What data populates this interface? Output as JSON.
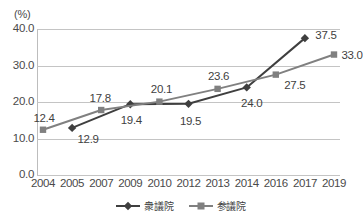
{
  "top_strip": {
    "faint_text": "——  ————  ——  ——————  ——  ———  ————"
  },
  "axis_unit_label": "(%)",
  "legend": {
    "items": [
      {
        "label": "衆議院",
        "marker": "diamond-marker",
        "color": "#3f3f3f"
      },
      {
        "label": "参議院",
        "marker": "square-marker",
        "color": "#808080"
      }
    ]
  },
  "chart_data": {
    "type": "line",
    "title": "",
    "subtitle": "",
    "xlabel": "",
    "ylabel": "(%)",
    "categories": [
      "2004",
      "2005",
      "2007",
      "2009",
      "2010",
      "2012",
      "2013",
      "2014",
      "2016",
      "2017",
      "2019"
    ],
    "ylim": [
      0.0,
      40.0
    ],
    "yticks": [
      "0.0",
      "10.0",
      "20.0",
      "30.0",
      "40.0"
    ],
    "ytick_values": [
      0.0,
      10.0,
      20.0,
      30.0,
      40.0
    ],
    "grid": true,
    "legend_position": "bottom",
    "series": [
      {
        "name": "衆議院",
        "color": "#3f3f3f",
        "marker": "diamond",
        "points": [
          {
            "x": "2005",
            "y": 12.9,
            "label": "12.9",
            "label_dx": 16,
            "label_dy": 11
          },
          {
            "x": "2009",
            "y": 19.4,
            "label": "19.4",
            "label_dx": 1,
            "label_dy": 16
          },
          {
            "x": "2012",
            "y": 19.5,
            "label": "19.5",
            "label_dx": 2,
            "label_dy": 17
          },
          {
            "x": "2014",
            "y": 24.0,
            "label": "24.0",
            "label_dx": 5,
            "label_dy": 16
          },
          {
            "x": "2017",
            "y": 37.5,
            "label": "37.5",
            "label_dx": 21,
            "label_dy": -3
          }
        ]
      },
      {
        "name": "参議院",
        "color": "#808080",
        "marker": "square",
        "points": [
          {
            "x": "2004",
            "y": 12.4,
            "label": "12.4",
            "label_dx": 1,
            "label_dy": -12
          },
          {
            "x": "2007",
            "y": 17.8,
            "label": "17.8",
            "label_dx": -1,
            "label_dy": -12
          },
          {
            "x": "2010",
            "y": 20.1,
            "label": "20.1",
            "label_dx": 2,
            "label_dy": -13
          },
          {
            "x": "2013",
            "y": 23.6,
            "label": "23.6",
            "label_dx": 1,
            "label_dy": -13
          },
          {
            "x": "2016",
            "y": 27.5,
            "label": "27.5",
            "label_dx": 19,
            "label_dy": 10
          },
          {
            "x": "2019",
            "y": 33.0,
            "label": "33.0",
            "label_dx": 18,
            "label_dy": 0
          }
        ]
      }
    ]
  }
}
